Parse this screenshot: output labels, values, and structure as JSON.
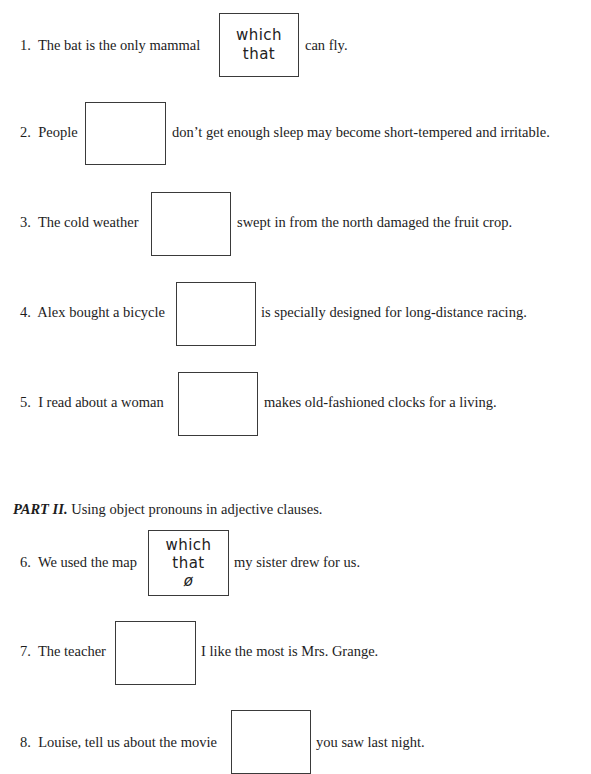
{
  "part2": {
    "label": "PART II.",
    "title": "Using object pronouns in adjective clauses."
  },
  "items": [
    {
      "num": "1.",
      "before": "The bat is the only mammal",
      "after": "can fly.",
      "answer": [
        "which",
        "that"
      ]
    },
    {
      "num": "2.",
      "before": "People",
      "after": "don’t get enough sleep may become short-tempered and irritable.",
      "answer": []
    },
    {
      "num": "3.",
      "before": "The cold weather",
      "after": "swept in from the north damaged the fruit crop.",
      "answer": []
    },
    {
      "num": "4.",
      "before": "Alex bought a bicycle",
      "after": "is specially designed for long-distance racing.",
      "answer": []
    },
    {
      "num": "5.",
      "before": "I read about a woman",
      "after": "makes old-fashioned clocks for a living.",
      "answer": []
    },
    {
      "num": "6.",
      "before": "We used the map",
      "after": "my sister drew for us.",
      "answer": [
        "which",
        "that",
        "ø"
      ]
    },
    {
      "num": "7.",
      "before": "The teacher",
      "after": "I like the most is Mrs. Grange.",
      "answer": []
    },
    {
      "num": "8.",
      "before": "Louise, tell us about the movie",
      "after": "you saw last night.",
      "answer": []
    }
  ]
}
